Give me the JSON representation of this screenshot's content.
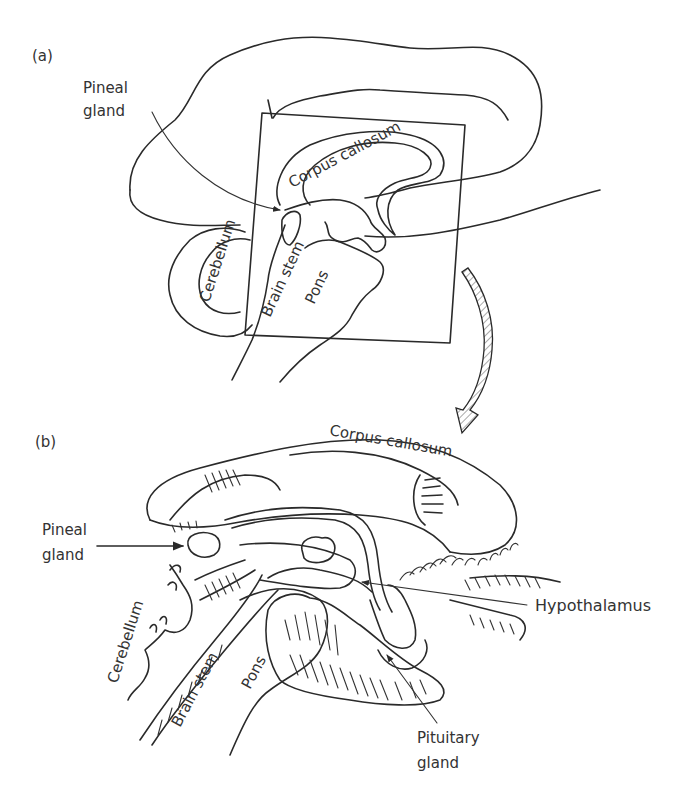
{
  "figure": {
    "panel_a": {
      "panel_label": "(a)",
      "labels": {
        "pineal_line1": "Pineal",
        "pineal_line2": "gland",
        "corpus_callosum": "Corpus callosum",
        "cerebellum": "Cerebellum",
        "brain_stem": "Brain stem",
        "pons": "Pons"
      }
    },
    "panel_b": {
      "panel_label": "(b)",
      "labels": {
        "corpus_callosum": "Corpus callosum",
        "pineal_line1": "Pineal",
        "pineal_line2": "gland",
        "hypothalamus": "Hypothalamus",
        "cerebellum": "Cerebellum",
        "brain_stem": "Brain stem",
        "pons": "Pons",
        "pituitary_line1": "Pituitary",
        "pituitary_line2": "gland"
      }
    },
    "colors": {
      "stroke": "#2a2a2a",
      "text": "#333333",
      "background": "#ffffff"
    }
  }
}
